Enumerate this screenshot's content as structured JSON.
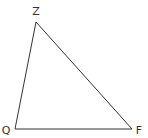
{
  "diagram": {
    "type": "triangle",
    "stroke_color": "#333333",
    "background": "#ffffff",
    "vertices": [
      {
        "label": "Z",
        "x": 36,
        "y": 22,
        "label_x": 36,
        "label_y": 15
      },
      {
        "label": "Q",
        "x": 15,
        "y": 129,
        "label_x": 6,
        "label_y": 134
      },
      {
        "label": "F",
        "x": 132,
        "y": 129,
        "label_x": 139,
        "label_y": 134
      }
    ],
    "edges": [
      [
        "Z",
        "F"
      ],
      [
        "F",
        "Q"
      ],
      [
        "Q",
        "Z"
      ]
    ]
  }
}
